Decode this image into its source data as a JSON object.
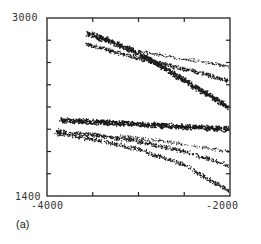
{
  "chart_data": {
    "type": "scatter",
    "title": "",
    "panel_label": "(a)",
    "xlabel": "",
    "ylabel": "",
    "xlim": [
      -4000,
      -2000
    ],
    "ylim": [
      1400,
      3000
    ],
    "x_tick_labels": [
      "-4000",
      "-2000"
    ],
    "y_tick_labels": [
      "3000",
      "1400"
    ],
    "x_minor_ticks": [
      -3500,
      -3000,
      -2500
    ],
    "y_minor_ticks": [
      2800,
      2600,
      2400,
      2200,
      2000,
      1800,
      1600
    ],
    "grid": false,
    "legend": null,
    "series": [
      {
        "name": "band-1",
        "density": "dense",
        "x": [
          -3560,
          -3300,
          -3000,
          -2700,
          -2400,
          -2000
        ],
        "y": [
          2860,
          2790,
          2680,
          2540,
          2390,
          2190
        ]
      },
      {
        "name": "band-2",
        "density": "medium",
        "x": [
          -3570,
          -3300,
          -3000,
          -2700,
          -2400,
          -2000
        ],
        "y": [
          2770,
          2700,
          2640,
          2580,
          2520,
          2430
        ]
      },
      {
        "name": "band-3",
        "density": "sparse",
        "x": [
          -3000,
          -2700,
          -2400,
          -2000
        ],
        "y": [
          2700,
          2660,
          2620,
          2560
        ]
      },
      {
        "name": "band-4",
        "density": "dense",
        "x": [
          -3850,
          -3500,
          -3000,
          -2500,
          -2000
        ],
        "y": [
          2080,
          2065,
          2045,
          2020,
          2000
        ]
      },
      {
        "name": "band-5",
        "density": "medium",
        "x": [
          -3900,
          -3500,
          -3000,
          -2500,
          -2000
        ],
        "y": [
          1985,
          1950,
          1890,
          1800,
          1670
        ]
      },
      {
        "name": "band-6",
        "density": "medium",
        "x": [
          -3900,
          -3500,
          -3000,
          -2500,
          -2000
        ],
        "y": [
          1965,
          1910,
          1820,
          1680,
          1440
        ]
      },
      {
        "name": "band-7",
        "density": "sparse",
        "x": [
          -3200,
          -2800,
          -2400,
          -2000
        ],
        "y": [
          1940,
          1900,
          1850,
          1800
        ]
      }
    ]
  },
  "labels": {
    "y_top": "3000",
    "y_bottom": "1400",
    "x_left": "-4000",
    "x_right": "-2000",
    "panel": "(a)"
  }
}
